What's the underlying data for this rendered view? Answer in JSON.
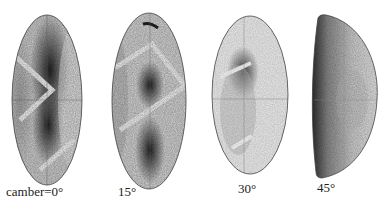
{
  "figure": {
    "panels": [
      {
        "label": "camber=0°",
        "camber_deg": 0
      },
      {
        "label": "15°",
        "camber_deg": 15
      },
      {
        "label": "30°",
        "camber_deg": 30
      },
      {
        "label": "45°",
        "camber_deg": 45
      }
    ]
  }
}
